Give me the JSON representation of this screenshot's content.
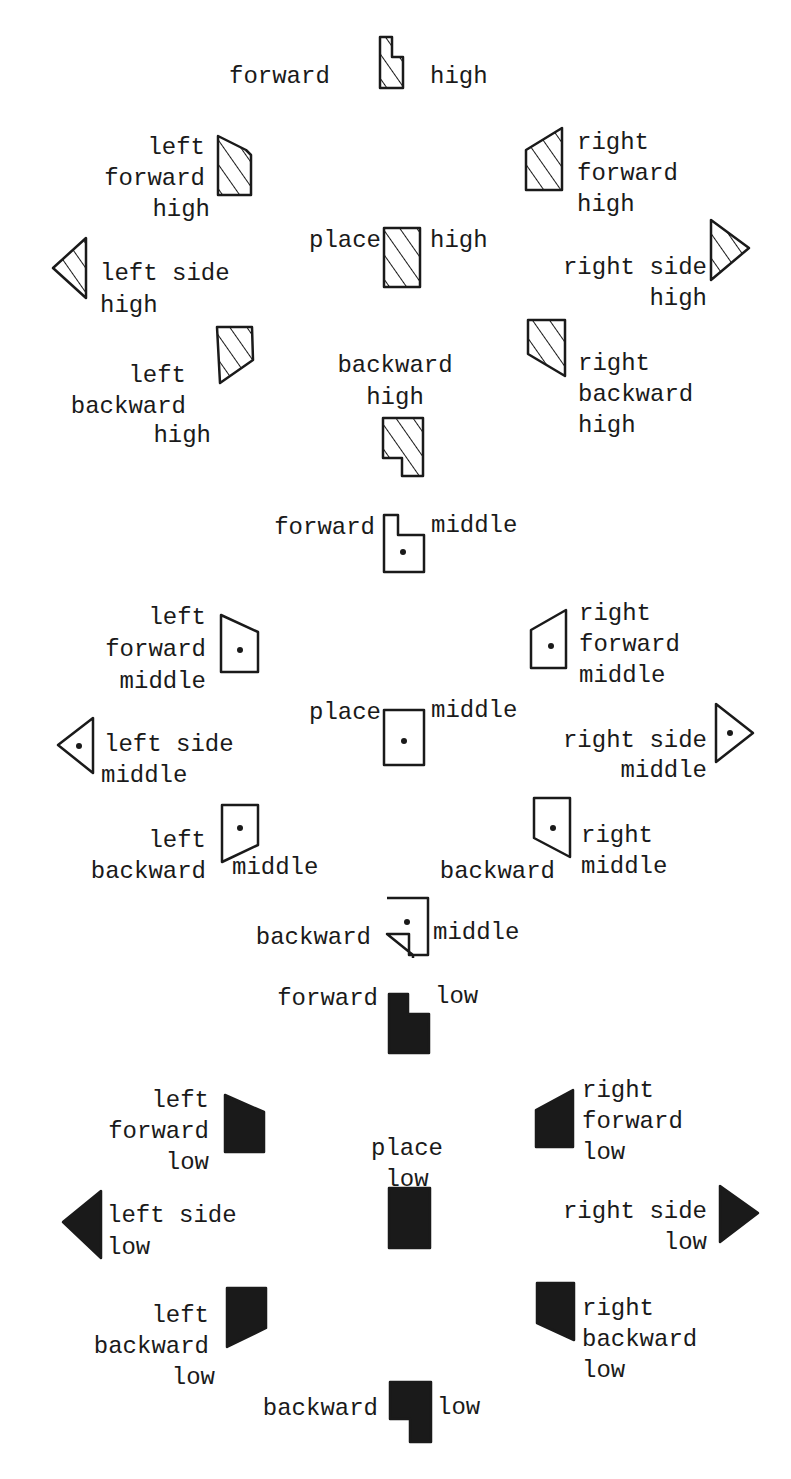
{
  "levels": {
    "high": {
      "fill": "hatched",
      "word": "high"
    },
    "middle": {
      "fill": "dot",
      "word": "middle"
    },
    "low": {
      "fill": "solid",
      "word": "low"
    }
  },
  "colors": {
    "ink": "#1a1a1a",
    "paper": "#ffffff"
  },
  "symbols": {
    "forward_high": {
      "label": [
        "forward",
        "high"
      ],
      "shape": "forward",
      "level": "high"
    },
    "left_forward_high": {
      "label": [
        "left",
        "forward",
        "high"
      ],
      "shape": "left-forward",
      "level": "high"
    },
    "right_forward_high": {
      "label": [
        "right",
        "forward",
        "high"
      ],
      "shape": "right-forward",
      "level": "high"
    },
    "place_high": {
      "label": [
        "place",
        "high"
      ],
      "shape": "place",
      "level": "high"
    },
    "left_side_high": {
      "label": [
        "left side",
        "high"
      ],
      "shape": "left-side",
      "level": "high"
    },
    "right_side_high": {
      "label": [
        "right side",
        "high"
      ],
      "shape": "right-side",
      "level": "high"
    },
    "left_backward_high": {
      "label": [
        "left",
        "backward",
        "high"
      ],
      "shape": "left-backward",
      "level": "high"
    },
    "backward_high": {
      "label": [
        "backward",
        "high"
      ],
      "shape": "backward",
      "level": "high"
    },
    "right_backward_high": {
      "label": [
        "right",
        "backward",
        "high"
      ],
      "shape": "right-backward",
      "level": "high"
    },
    "forward_middle": {
      "label": [
        "forward",
        "middle"
      ],
      "shape": "forward",
      "level": "middle"
    },
    "left_forward_middle": {
      "label": [
        "left",
        "forward",
        "middle"
      ],
      "shape": "left-forward",
      "level": "middle"
    },
    "right_forward_middle": {
      "label": [
        "right",
        "forward",
        "middle"
      ],
      "shape": "right-forward",
      "level": "middle"
    },
    "place_middle": {
      "label": [
        "place",
        "middle"
      ],
      "shape": "place",
      "level": "middle"
    },
    "left_side_middle": {
      "label": [
        "left side",
        "middle"
      ],
      "shape": "left-side",
      "level": "middle"
    },
    "right_side_middle": {
      "label": [
        "right side",
        "middle"
      ],
      "shape": "right-side",
      "level": "middle"
    },
    "left_backward_middle": {
      "label": [
        "left",
        "backward",
        "middle"
      ],
      "shape": "left-backward",
      "level": "middle"
    },
    "right_backward_middle": {
      "label": [
        "right",
        "backward",
        "middle"
      ],
      "shape": "right-backward",
      "level": "middle"
    },
    "backward_middle": {
      "label": [
        "backward",
        "middle"
      ],
      "shape": "backward",
      "level": "middle"
    },
    "forward_low": {
      "label": [
        "forward",
        "low"
      ],
      "shape": "forward",
      "level": "low"
    },
    "left_forward_low": {
      "label": [
        "left",
        "forward",
        "low"
      ],
      "shape": "left-forward",
      "level": "low"
    },
    "right_forward_low": {
      "label": [
        "right",
        "forward",
        "low"
      ],
      "shape": "right-forward",
      "level": "low"
    },
    "place_low": {
      "label": [
        "place",
        "low"
      ],
      "shape": "place",
      "level": "low"
    },
    "left_side_low": {
      "label": [
        "left side",
        "low"
      ],
      "shape": "left-side",
      "level": "low"
    },
    "right_side_low": {
      "label": [
        "right side",
        "low"
      ],
      "shape": "right-side",
      "level": "low"
    },
    "left_backward_low": {
      "label": [
        "left",
        "backward",
        "low"
      ],
      "shape": "left-backward",
      "level": "low"
    },
    "right_backward_low": {
      "label": [
        "right",
        "backward",
        "low"
      ],
      "shape": "right-backward",
      "level": "low"
    },
    "backward_low": {
      "label": [
        "backward",
        "low"
      ],
      "shape": "backward",
      "level": "low"
    }
  }
}
